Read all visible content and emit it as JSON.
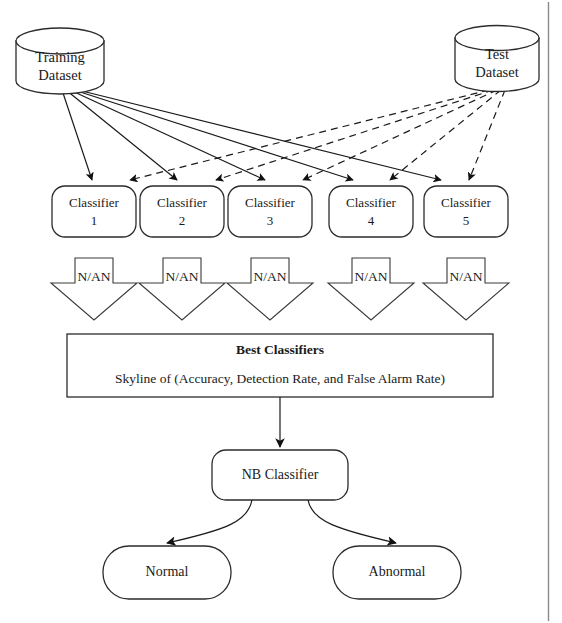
{
  "diagram": {
    "colors": {
      "stroke": "#2b2b2b",
      "text": "#1a1a1a",
      "background": "#ffffff",
      "frame": "#8a8a8a"
    },
    "sources": [
      {
        "id": "training-dataset",
        "line1": "Training",
        "line2": "Dataset",
        "shape": "cylinder"
      },
      {
        "id": "test-dataset",
        "line1": "Test",
        "line2": "Dataset",
        "shape": "cylinder"
      }
    ],
    "classifiers": [
      {
        "id": "classifier-1",
        "line1": "Classifier",
        "line2": "1"
      },
      {
        "id": "classifier-2",
        "line1": "Classifier",
        "line2": "2"
      },
      {
        "id": "classifier-3",
        "line1": "Classifier",
        "line2": "3"
      },
      {
        "id": "classifier-4",
        "line1": "Classifier",
        "line2": "4"
      },
      {
        "id": "classifier-5",
        "line1": "Classifier",
        "line2": "5"
      }
    ],
    "outputs_label": "N/AN",
    "output_arrows": [
      {
        "id": "output-arrow-1",
        "label": "N/AN"
      },
      {
        "id": "output-arrow-2",
        "label": "N/AN"
      },
      {
        "id": "output-arrow-3",
        "label": "N/AN"
      },
      {
        "id": "output-arrow-4",
        "label": "N/AN"
      },
      {
        "id": "output-arrow-5",
        "label": "N/AN"
      }
    ],
    "best_classifiers": {
      "title": "Best Classifiers",
      "subtitle": "Skyline of (Accuracy, Detection Rate, and False Alarm Rate)"
    },
    "nb_classifier": {
      "label": "NB Classifier"
    },
    "results": [
      {
        "id": "result-normal",
        "label": "Normal"
      },
      {
        "id": "result-abnormal",
        "label": "Abnormal"
      }
    ],
    "edge_styles": {
      "training_to_classifier": "solid",
      "test_to_classifier": "dashed"
    }
  }
}
